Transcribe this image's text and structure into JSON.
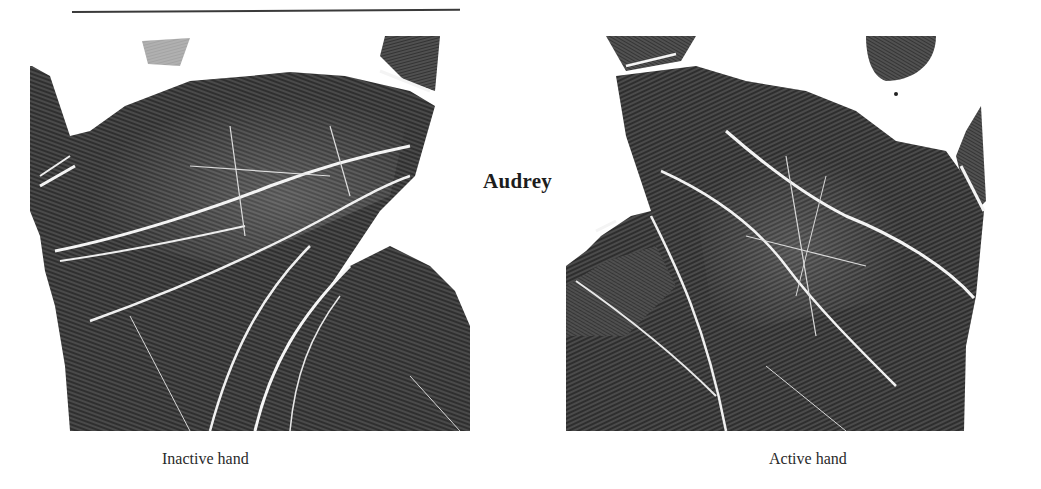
{
  "page": {
    "title": "Audrey",
    "figures": [
      {
        "id": "inactive",
        "caption": "Inactive hand"
      },
      {
        "id": "active",
        "caption": "Active hand"
      }
    ]
  },
  "colors": {
    "ink": "#2b2b2b",
    "ink_dark": "#1a1a1a",
    "paper": "#ffffff",
    "crease": "#f2f2f2"
  }
}
